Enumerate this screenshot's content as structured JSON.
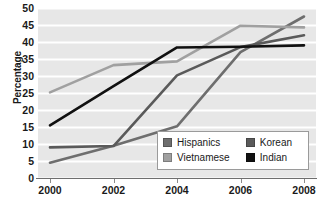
{
  "chart_data": {
    "type": "line",
    "title": "",
    "xlabel": "",
    "ylabel": "Percentage",
    "x": [
      2000,
      2002,
      2004,
      2006,
      2008
    ],
    "xtick_labels": [
      "2000",
      "2002",
      "2004",
      "2006",
      "2008"
    ],
    "ytick_labels": [
      "0",
      "5",
      "10",
      "15",
      "20",
      "25",
      "30",
      "35",
      "40",
      "45",
      "50"
    ],
    "ytick_values": [
      0,
      5,
      10,
      15,
      20,
      25,
      30,
      35,
      40,
      45,
      50
    ],
    "ylim": [
      0,
      50
    ],
    "xlim": [
      2000,
      2008
    ],
    "grid": "horizontal",
    "legend_position": "inside-bottom-right",
    "plot_background": "#e7e7e7",
    "gridline_color": "#ffffff",
    "series": [
      {
        "name": "Hispanics",
        "color": "#6e6e6e",
        "values": [
          4.5,
          9.5,
          15.2,
          37.0,
          47.5
        ]
      },
      {
        "name": "Vietnamese",
        "color": "#a0a0a0",
        "values": [
          25.2,
          33.2,
          34.3,
          44.8,
          44.3
        ]
      },
      {
        "name": "Korean",
        "color": "#5a5a5a",
        "values": [
          9.0,
          9.4,
          30.2,
          38.5,
          42.0
        ]
      },
      {
        "name": "Indian",
        "color": "#111111",
        "values": [
          15.5,
          27.0,
          38.4,
          38.6,
          39.0
        ]
      }
    ]
  },
  "legend": {
    "rows": [
      {
        "left_label": "Hispanics",
        "right_label": "Korean"
      },
      {
        "left_label": "Vietnamese",
        "right_label": "Indian"
      }
    ]
  }
}
